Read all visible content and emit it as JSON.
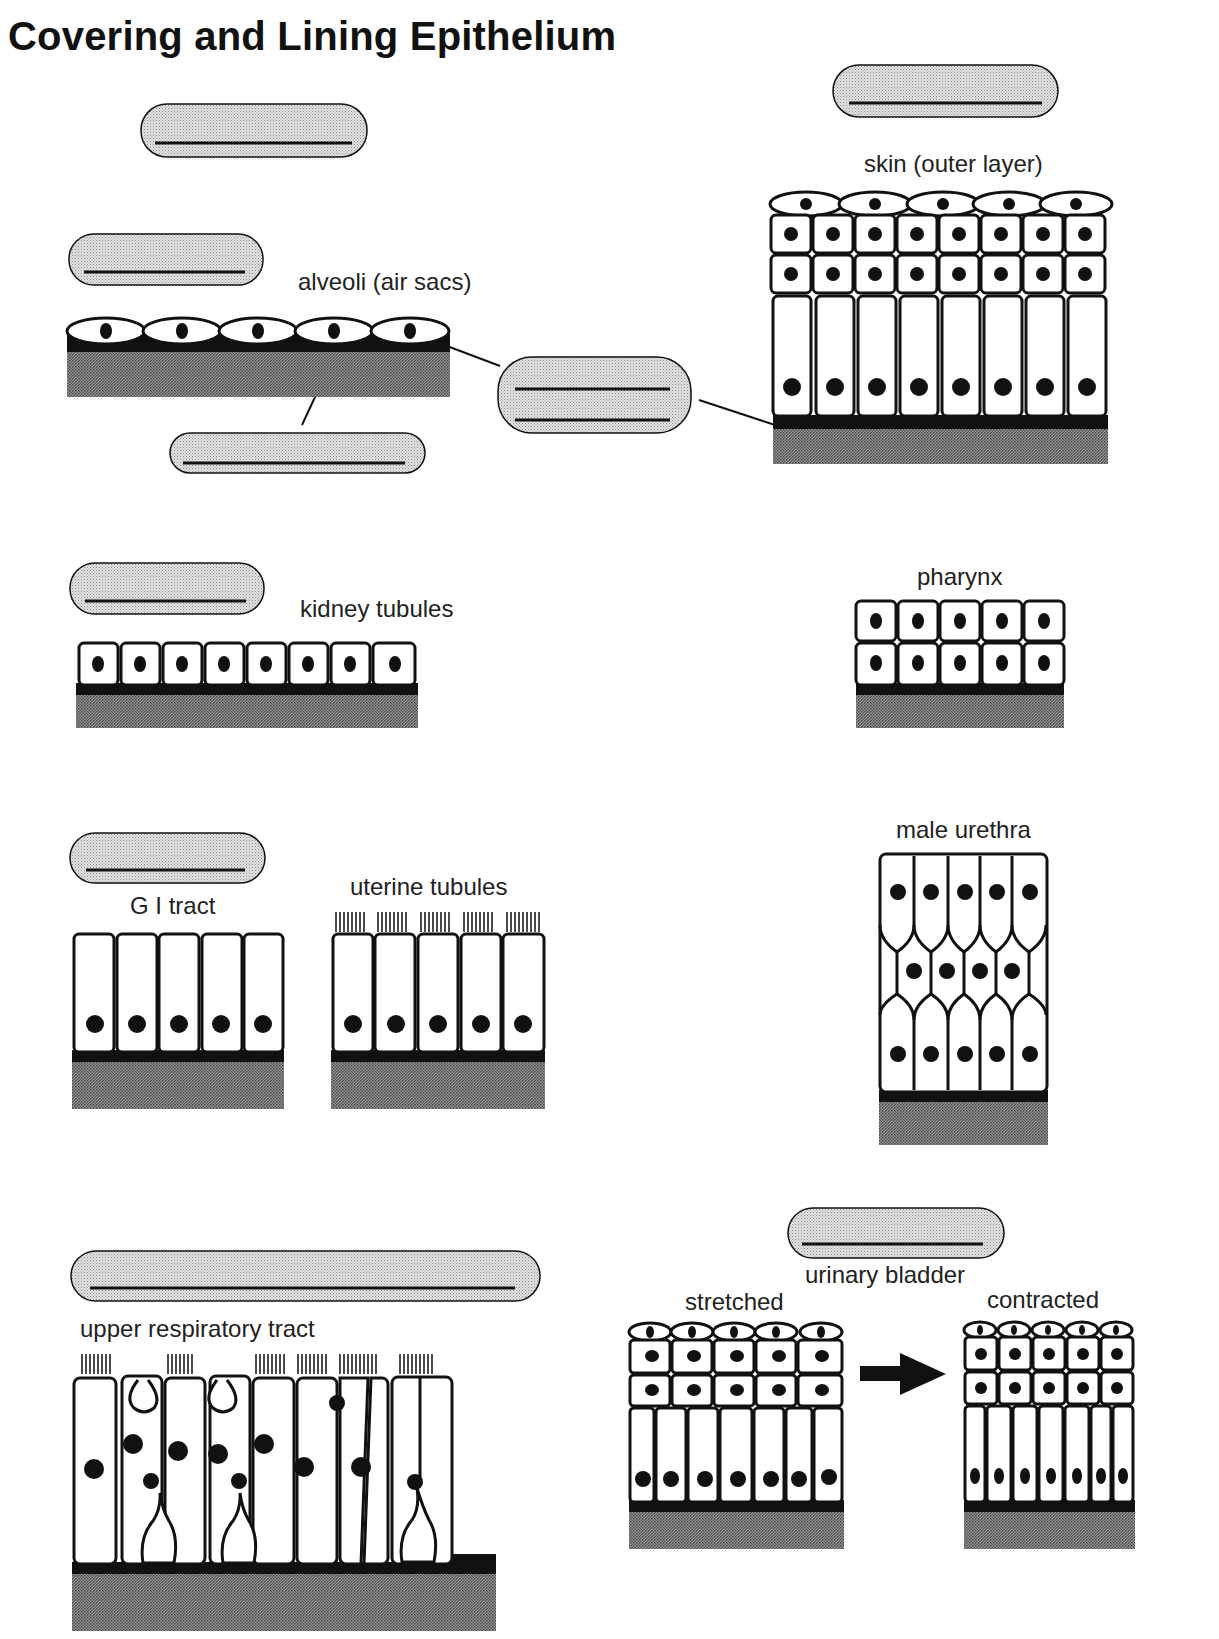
{
  "title": "Covering and Lining Epithelium",
  "labels": {
    "alveoli": "alveoli (air sacs)",
    "skin": "skin (outer layer)",
    "kidney": "kidney tubules",
    "pharynx": "pharynx",
    "male_urethra": "male urethra",
    "gi_tract": "G I tract",
    "uterine": "uterine tubules",
    "upper_resp": "upper respiratory tract",
    "bladder": "urinary bladder",
    "stretched": "stretched",
    "contracted": "contracted"
  },
  "blank_label_boxes": [
    {
      "id": "top-left-box",
      "lines": 1
    },
    {
      "id": "skin-box",
      "lines": 1
    },
    {
      "id": "alveoli-box",
      "lines": 1
    },
    {
      "id": "basement-membrane-box",
      "lines": 1
    },
    {
      "id": "center-two-line-box",
      "lines": 2
    },
    {
      "id": "kidney-box",
      "lines": 1
    },
    {
      "id": "gi-box",
      "lines": 1
    },
    {
      "id": "upper-resp-box",
      "lines": 1
    },
    {
      "id": "bladder-box",
      "lines": 1
    }
  ],
  "tissues": [
    {
      "name": "alveoli",
      "cells": 5,
      "type": "simple squamous"
    },
    {
      "name": "skin",
      "layers": [
        5,
        8,
        8,
        8
      ],
      "type": "stratified squamous"
    },
    {
      "name": "kidney tubules",
      "cells": 8,
      "type": "simple cuboidal"
    },
    {
      "name": "pharynx",
      "layers": [
        5,
        5
      ],
      "type": "stratified cuboidal"
    },
    {
      "name": "male urethra",
      "layers": [
        5,
        4,
        5
      ],
      "type": "stratified columnar"
    },
    {
      "name": "G I tract",
      "cells": 5,
      "type": "simple columnar"
    },
    {
      "name": "uterine tubules",
      "cells": 5,
      "cilia": true,
      "type": "ciliated simple columnar"
    },
    {
      "name": "upper respiratory tract",
      "type": "pseudostratified ciliated columnar"
    },
    {
      "name": "urinary bladder stretched",
      "layers": [
        5,
        5,
        5,
        7
      ],
      "type": "transitional"
    },
    {
      "name": "urinary bladder contracted",
      "layers": [
        5,
        5,
        5,
        7
      ],
      "type": "transitional"
    }
  ],
  "colors": {
    "ink": "#111111",
    "stipple": "#bdbdbd",
    "tissue": "#7a7a7a",
    "cell": "#ffffff"
  }
}
